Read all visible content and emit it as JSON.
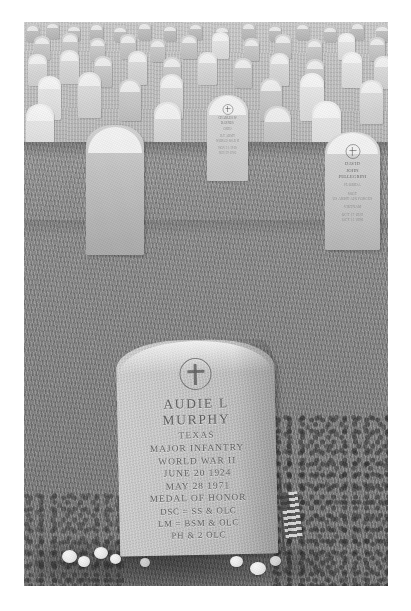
{
  "photo": {
    "subject": "Grave of Audie L. Murphy, Arlington National Cemetery",
    "medium": "black-and-white photograph with white border",
    "border_color": "#ffffff"
  },
  "main_headstone": {
    "emblem": "latin-cross-in-circle",
    "name_line_1": "AUDIE L",
    "name_line_2": "MURPHY",
    "state": "TEXAS",
    "rank_branch": "MAJOR   INFANTRY",
    "conflict": "WORLD WAR II",
    "birth_date": "JUNE 20 1924",
    "death_date": "MAY 28 1971",
    "award_1": "MEDAL OF HONOR",
    "award_2": "DSC = SS & OLC",
    "award_3": "LM = BSM & OLC",
    "award_4": "PH & 2 OLC"
  },
  "background_headstone_right": {
    "emblem": "latin-cross-in-circle",
    "name_line_1": "DAVID",
    "name_line_2": "JOHN",
    "name_line_3": "PELLEGRINI",
    "sub_line_1": "FLORIDA",
    "sub_line_2": "SSGT",
    "sub_line_3": "US ARMY AIR FORCES",
    "sub_line_4": "VIETNAM",
    "sub_line_5": "OCT 17 1929",
    "sub_line_6": "OCT 11 1998"
  },
  "background_headstone_center": {
    "emblem": "latin-cross-in-circle",
    "name_line_1": "CHARLES W",
    "name_line_2": "BARNES",
    "sub_line_1": "OHIO",
    "sub_line_2": "1LT  ARMY",
    "sub_line_3": "WORLD WAR II",
    "sub_line_4": "NOV 11 1918",
    "sub_line_5": "JUN 29 1985"
  },
  "scene_elements": {
    "flag_label": "american-flag",
    "flowers_label": "white-flowers",
    "grass_label": "cemetery-lawn",
    "rows_label": "rows-of-headstones"
  }
}
